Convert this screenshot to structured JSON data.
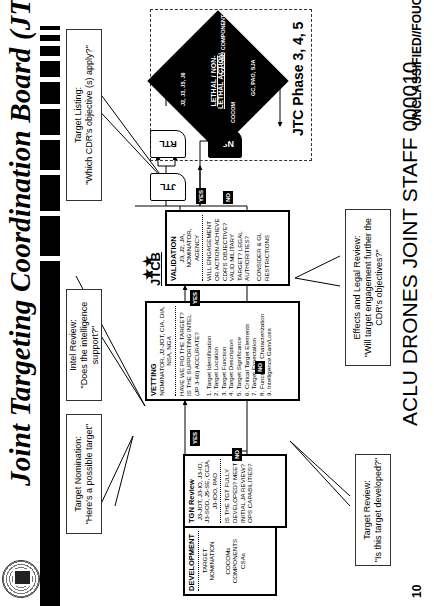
{
  "header": {
    "title": "Joint Targeting Coordination Board (JTCB)",
    "seal_icon": "joint-staff-seal"
  },
  "callouts": {
    "target_nomination": {
      "title": "Target Nomination:",
      "question": "\"Here's a possible target\""
    },
    "target_review": {
      "title": "Target Review:",
      "question": "\"Is this target developed?\""
    },
    "intel_review": {
      "title": "Intel Review:",
      "question": "\"Does the intelligence support?\""
    },
    "effects_legal_review": {
      "title": "Effects and Legal Review:",
      "question": "\"Will target engagement further the CDR's objectives?\""
    },
    "target_listing": {
      "title": "Target Listing:",
      "question": "\"Which CDR's objective (s) apply?\""
    }
  },
  "boxes": {
    "development": {
      "heading": "DEVELOPMENT",
      "line1": "TARGET",
      "line2": "NOMINATION",
      "line3": "COCOMs",
      "line4": "COMPONENTS",
      "line5": "CSAs"
    },
    "tgn_review": {
      "heading": "TGN Review",
      "participants": "J3-JOT, J3-IO, J3-IO, J3-SOD, J5-SE, CCJA, J3-IOO, PAO",
      "question": "IS THE TGT FULLY DEVELOPED? MEET INITIAL JA REVIEW? OPS CAPABILITIES?"
    },
    "vetting": {
      "heading": "VETTING",
      "participants": "NOMINATOR, J2-JOT, CIA, DIA, NSA, NGA",
      "question": "HAVE WE PID THE TARGET? IS THE SUPPORTING INTEL (JP 3-60) ACCURATE?",
      "items": [
        "1. Target Identification",
        "2. Target Location",
        "3. Target Function",
        "4. Target Description",
        "5. Target Significance",
        "6. Critical Target Elements",
        "7. Target Expectation",
        "8. Functional Characterization",
        "9. Intelligence Gain/Loss"
      ]
    },
    "validation": {
      "jtcb_label": "JTCB",
      "heading": "VALIDATION",
      "participants": "J3, J2, JA, NOMINATOR, AGENCY",
      "question": "WILL ENGAGEMENT OR ACTION ACHIEVE CDR'S OBJECTIVE? VALID MILITARY TARGET? LEGAL AUTHORITIES?",
      "note": "CONSIDER & GL RESTRICTIONS"
    }
  },
  "decision_tags": {
    "yes_tgn_to_vetting": "YES",
    "no_tgn": "NO",
    "yes_vetting_to_validation": "YES",
    "no_vetting": "NO",
    "yes_validation": "YES",
    "no_validation": "NO"
  },
  "lists": {
    "jtl": "JTL",
    "rtl": "RTL",
    "nsl": "NSL"
  },
  "diamond": {
    "top_text": "J2, J3, J5, J6",
    "center_line1": "LETHAL / NON-",
    "center_line2": "LETHAL ACTION",
    "right_text": "GC, PAO, SJA",
    "bottom_text": "COCOM / COMPONENT",
    "left_text": "COCOM"
  },
  "phase_label": "JTC Phase 3, 4, 5",
  "footer": {
    "page_number": "10",
    "bates": "ACLU DRONES JOINT STAFF  000010",
    "classification": "UNCLASSIFIED//FOUO"
  }
}
